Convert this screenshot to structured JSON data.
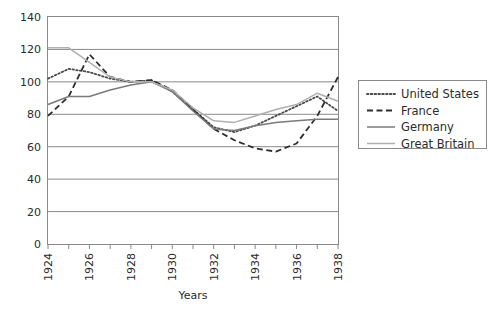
{
  "chart_data": {
    "type": "line",
    "title": "",
    "xlabel": "Years",
    "ylabel": "",
    "xlim": [
      1924,
      1938
    ],
    "ylim": [
      0,
      140
    ],
    "ytick_step": 20,
    "yticks": [
      0,
      20,
      40,
      60,
      80,
      100,
      120,
      140
    ],
    "xticks": [
      1924,
      1925,
      1926,
      1927,
      1928,
      1929,
      1930,
      1931,
      1932,
      1933,
      1934,
      1935,
      1936,
      1937,
      1938
    ],
    "xtick_labels": [
      "1924",
      "",
      "1926",
      "",
      "1928",
      "",
      "1930",
      "",
      "1932",
      "",
      "1934",
      "",
      "1936",
      "",
      "1938"
    ],
    "xtick_labels_visible": [
      "1924",
      "1926",
      "1928",
      "1930",
      "1932",
      "1934",
      "1936",
      "1938"
    ],
    "grid": "horizontal",
    "legend_position": "right-outside",
    "x": [
      1924,
      1925,
      1926,
      1927,
      1928,
      1929,
      1930,
      1931,
      1932,
      1933,
      1934,
      1935,
      1936,
      1937,
      1938
    ],
    "series": [
      {
        "name": "United States",
        "style": "dotted",
        "color": "#4a4a4a",
        "values": [
          102,
          108,
          106,
          102,
          100,
          101,
          94,
          83,
          72,
          69,
          73,
          79,
          85,
          91,
          82
        ]
      },
      {
        "name": "France",
        "style": "dashed",
        "color": "#2e2e2e",
        "values": [
          79,
          91,
          117,
          103,
          100,
          101,
          95,
          83,
          71,
          64,
          59,
          57,
          62,
          79,
          103
        ]
      },
      {
        "name": "Germany",
        "style": "solid",
        "color": "#7a7a7a",
        "values": [
          86,
          91,
          91,
          95,
          98,
          100,
          94,
          82,
          71,
          70,
          73,
          75,
          76,
          77,
          77
        ]
      },
      {
        "name": "Great Britain",
        "style": "solid-light",
        "color": "#b0b0b0",
        "values": [
          121,
          121,
          112,
          103,
          100,
          100,
          95,
          84,
          76,
          75,
          79,
          83,
          86,
          93,
          88
        ]
      }
    ]
  },
  "axes": {
    "xlabel": "Years",
    "y_tick_labels": [
      "140",
      "120",
      "100",
      "80",
      "60",
      "40",
      "20",
      "0"
    ],
    "x_tick_labels": [
      "1924",
      "1926",
      "1928",
      "1930",
      "1932",
      "1934",
      "1936",
      "1938"
    ]
  },
  "legend": {
    "items": [
      {
        "label": "United States",
        "style": "dotted"
      },
      {
        "label": "France",
        "style": "dashed"
      },
      {
        "label": "Germany",
        "style": "solid"
      },
      {
        "label": "Great Britain",
        "style": "solid-light"
      }
    ]
  },
  "colors": {
    "plot_border": "#8a8a8a",
    "gridline": "#8a8a8a",
    "legend_border": "#8a8a8a",
    "background": "#ffffff"
  }
}
